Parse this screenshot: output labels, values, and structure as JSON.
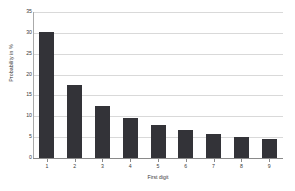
{
  "chart_data": {
    "type": "bar",
    "title": "",
    "xlabel": "First digit",
    "ylabel": "Probability in %",
    "categories": [
      "1",
      "2",
      "3",
      "4",
      "5",
      "6",
      "7",
      "8",
      "9"
    ],
    "values": [
      30.1,
      17.6,
      12.5,
      9.7,
      7.9,
      6.7,
      5.8,
      5.1,
      4.6
    ],
    "ylim": [
      0,
      35
    ],
    "yticks": [
      0,
      5,
      10,
      15,
      20,
      25,
      30,
      35
    ],
    "ytick_labels": [
      "0",
      "5",
      "10",
      "15",
      "20",
      "25",
      "30",
      "35"
    ],
    "grid": true,
    "grid_axis": "y",
    "legend": false,
    "bar_color": "#333338",
    "grid_color": "#d9d9d9",
    "axis_color": "#8a8a8a",
    "background": "#ffffff"
  }
}
